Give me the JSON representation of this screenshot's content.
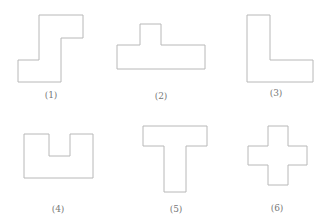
{
  "figure": {
    "stroke_color": "#b8b8b8",
    "label_color": "#777777",
    "shapes": [
      {
        "label": "(1)",
        "name": "S-step shape",
        "points": "39,15 83,15 83,38 61,38 61,82 18,82 18,60 39,60",
        "label_x": 51,
        "label_y": 90
      },
      {
        "label": "(2)",
        "name": "inverted-T shape",
        "points": "140,24 161,24 161,45 205,45 205,69 117,69 117,45 140,45",
        "label_x": 161,
        "label_y": 91
      },
      {
        "label": "(3)",
        "name": "L shape",
        "points": "247,15 270,15 270,60 313,60 313,82 247,82",
        "label_x": 276,
        "label_y": 88
      },
      {
        "label": "(4)",
        "name": "U shape",
        "points": "24,134 49,134 49,156 70,156 70,134 93,134 93,178 24,178",
        "label_x": 58,
        "label_y": 204
      },
      {
        "label": "(5)",
        "name": "T shape",
        "points": "143,126 207,126 207,146 186,146 186,192 164,192 164,146 143,146",
        "label_x": 176,
        "label_y": 204
      },
      {
        "label": "(6)",
        "name": "cross shape",
        "points": "268,126 288,126 288,146 307,146 307,165 288,165 288,185 268,185 268,165 248,165 248,146 268,146",
        "label_x": 277,
        "label_y": 203
      }
    ]
  }
}
